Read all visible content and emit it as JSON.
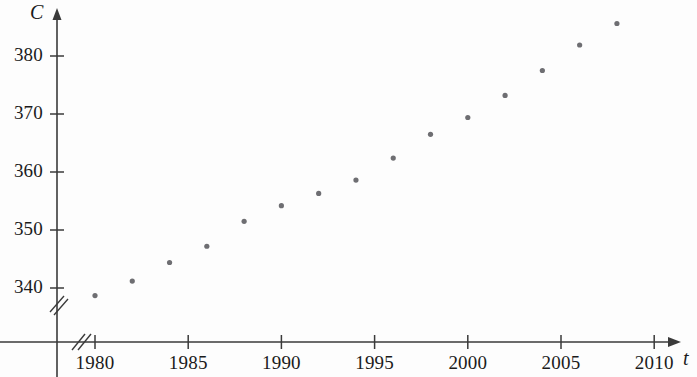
{
  "chart_data": {
    "type": "scatter",
    "title": "",
    "xlabel": "t",
    "ylabel": "C",
    "x": [
      1980,
      1982,
      1984,
      1986,
      1988,
      1990,
      1992,
      1994,
      1996,
      1998,
      2000,
      2002,
      2004,
      2006,
      2008
    ],
    "values": [
      338.7,
      341.2,
      344.4,
      347.2,
      351.5,
      354.2,
      356.3,
      358.6,
      362.4,
      366.5,
      369.4,
      373.2,
      377.5,
      381.9,
      385.6
    ],
    "series": [
      {
        "name": "CO2 concentration",
        "values": [
          338.7,
          341.2,
          344.4,
          347.2,
          351.5,
          354.2,
          356.3,
          358.6,
          362.4,
          366.5,
          369.4,
          373.2,
          377.5,
          381.9,
          385.6
        ]
      }
    ],
    "xlim": [
      1978.2,
      2011.5
    ],
    "ylim": [
      336.0,
      387.5
    ],
    "xticks": [
      1980,
      1985,
      1990,
      1995,
      2000,
      2005,
      2010
    ],
    "xtick_labels": [
      "1980",
      "1985",
      "1990",
      "1995",
      "2000",
      "2005",
      "2010"
    ],
    "yticks": [
      340,
      350,
      360,
      370,
      380
    ],
    "ytick_labels": [
      "340",
      "350",
      "360",
      "370",
      "380"
    ],
    "grid": false,
    "legend": null,
    "axis_break_x": true,
    "axis_break_y": true,
    "point_color": "#6e6e72",
    "axis_color": "#3a3a3a"
  },
  "axes": {
    "y_axis_name": "C",
    "x_axis_name": "t"
  }
}
